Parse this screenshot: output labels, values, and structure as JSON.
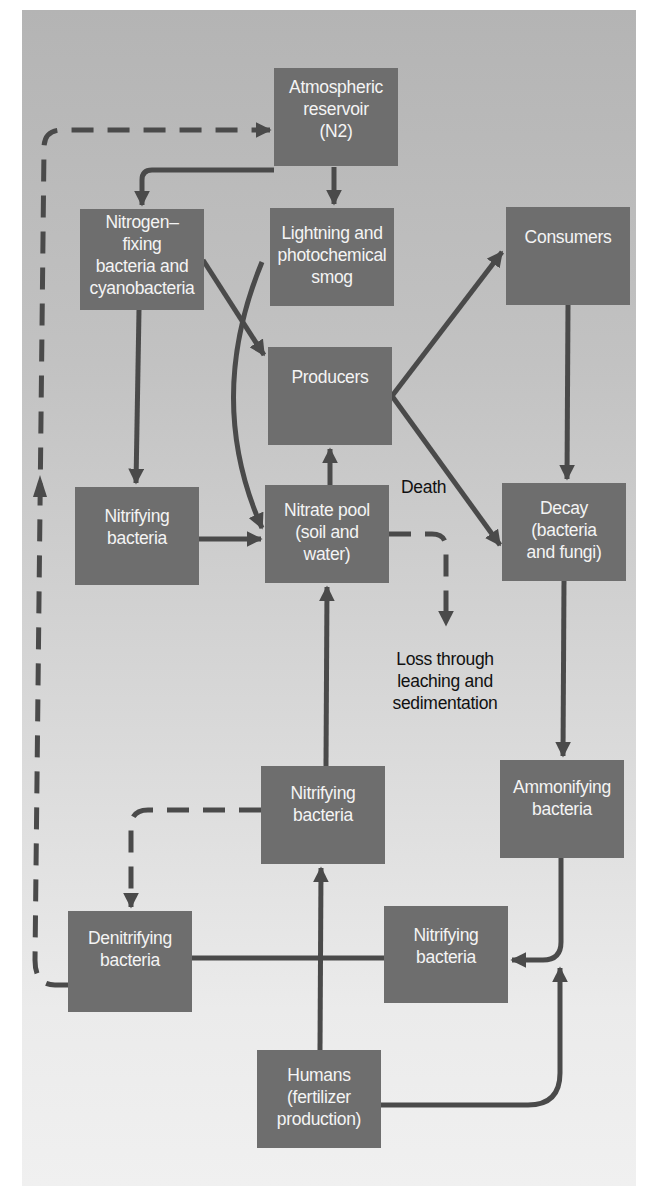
{
  "colors": {
    "box": "#6e6e6e",
    "arrow": "#4a4a4a",
    "box_text": "#f4f4f4",
    "label_text": "#111111"
  },
  "nodes": {
    "atmospheric": {
      "lines": [
        "Atmospheric",
        "reservoir",
        "(N2)"
      ]
    },
    "nitrogen_fixing": {
      "lines": [
        "Nitrogen–",
        "fixing",
        "bacteria and",
        "cyanobacteria"
      ]
    },
    "lightning": {
      "lines": [
        "Lightning and",
        "photochemical",
        "smog"
      ]
    },
    "consumers": {
      "lines": [
        "Consumers"
      ]
    },
    "producers": {
      "lines": [
        "Producers"
      ]
    },
    "nitrifying_left": {
      "lines": [
        "Nitrifying",
        "bacteria"
      ]
    },
    "nitrate_pool": {
      "lines": [
        "Nitrate pool",
        "(soil and",
        "water)"
      ]
    },
    "decay": {
      "lines": [
        "Decay",
        "(bacteria",
        "and fungi)"
      ]
    },
    "nitrifying_middle": {
      "lines": [
        "Nitrifying",
        "bacteria"
      ]
    },
    "ammonifying": {
      "lines": [
        "Ammonifying",
        "bacteria"
      ]
    },
    "denitrifying": {
      "lines": [
        "Denitrifying",
        "bacteria"
      ]
    },
    "nitrifying_bottom": {
      "lines": [
        "Nitrifying",
        "bacteria"
      ]
    },
    "humans": {
      "lines": [
        "Humans",
        "(fertilizer",
        "production)"
      ]
    }
  },
  "labels": {
    "death": "Death",
    "loss": [
      "Loss through",
      "leaching and",
      "sedimentation"
    ]
  },
  "links": [
    {
      "from": "atmospheric",
      "to": "nitrogen_fixing",
      "style": "solid"
    },
    {
      "from": "atmospheric",
      "to": "lightning",
      "style": "solid"
    },
    {
      "from": "nitrogen_fixing",
      "to": "producers",
      "style": "solid"
    },
    {
      "from": "nitrogen_fixing",
      "to": "nitrifying_left",
      "style": "solid"
    },
    {
      "from": "lightning",
      "to": "nitrate_pool",
      "style": "solid"
    },
    {
      "from": "producers",
      "to": "consumers",
      "style": "solid"
    },
    {
      "from": "producers",
      "to": "decay",
      "style": "solid",
      "label": "Death"
    },
    {
      "from": "consumers",
      "to": "decay",
      "style": "solid"
    },
    {
      "from": "nitrifying_left",
      "to": "nitrate_pool",
      "style": "solid"
    },
    {
      "from": "nitrate_pool",
      "to": "producers",
      "style": "solid"
    },
    {
      "from": "nitrate_pool",
      "to": "loss",
      "style": "dashed"
    },
    {
      "from": "decay",
      "to": "ammonifying",
      "style": "solid"
    },
    {
      "from": "nitrifying_middle",
      "to": "nitrate_pool",
      "style": "solid"
    },
    {
      "from": "nitrifying_middle",
      "to": "denitrifying",
      "style": "dashed"
    },
    {
      "from": "ammonifying",
      "to": "nitrifying_bottom",
      "style": "solid"
    },
    {
      "from": "denitrifying",
      "to": "atmospheric",
      "style": "dashed"
    },
    {
      "from": "denitrifying",
      "to": "nitrifying_bottom",
      "style": "solid"
    },
    {
      "from": "humans",
      "to": "nitrifying_middle",
      "style": "solid"
    },
    {
      "from": "humans",
      "to": "nitrifying_bottom",
      "style": "solid"
    }
  ]
}
